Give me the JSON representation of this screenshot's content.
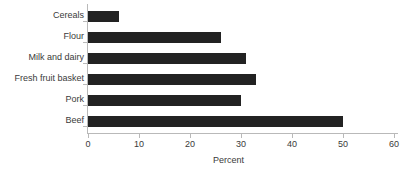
{
  "chart_data": {
    "type": "bar",
    "orientation": "horizontal",
    "title": "",
    "xlabel": "Percent",
    "ylabel": "",
    "categories": [
      "Cereals",
      "Flour",
      "Milk and dairy",
      "Fresh fruit basket",
      "Pork",
      "Beef"
    ],
    "values": [
      6,
      26,
      31,
      33,
      30,
      50
    ],
    "xlim": [
      0,
      60
    ],
    "xticks": [
      0,
      10,
      20,
      30,
      40,
      50,
      60
    ],
    "xtick_labels": [
      "0",
      "10",
      "20",
      "30",
      "40",
      "50",
      "60"
    ],
    "grid": false,
    "legend": false,
    "bar_color": "#222222",
    "axis_color": "#b9b9b9",
    "text_color": "#3a3a3a"
  }
}
